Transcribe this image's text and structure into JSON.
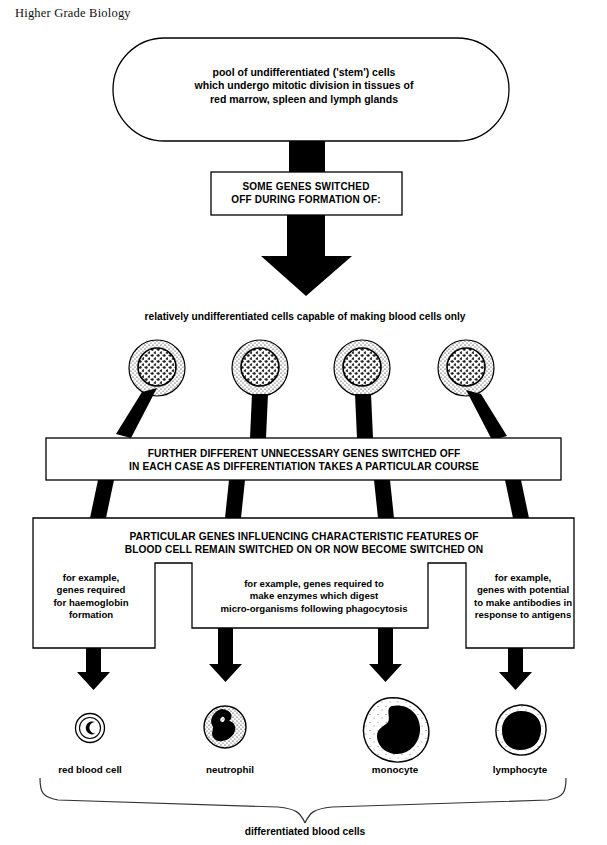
{
  "page": {
    "header": "Higher Grade Biology",
    "caption": "differentiated blood cells"
  },
  "boxes": {
    "stem_pool": {
      "line1": "pool of undifferentiated ('stem') cells",
      "line2": "which undergo mitotic division in tissues of",
      "line3": "red marrow, spleen and lymph glands"
    },
    "some_genes": {
      "line1": "SOME GENES SWITCHED",
      "line2": "OFF DURING FORMATION OF:"
    },
    "relatively_label": "relatively undifferentiated cells capable of making blood cells only",
    "further_genes": {
      "line1": "FURTHER DIFFERENT UNNECESSARY GENES SWITCHED OFF",
      "line2": "IN EACH CASE AS DIFFERENTIATION TAKES A PARTICULAR COURSE"
    },
    "particular_genes": {
      "line1": "PARTICULAR GENES INFLUENCING CHARACTERISTIC FEATURES OF",
      "line2": "BLOOD CELL REMAIN SWITCHED ON OR NOW BECOME SWITCHED ON"
    },
    "examples": [
      {
        "id": "haemoglobin",
        "line1": "for example,",
        "line2": "genes required",
        "line3": "for haemoglobin",
        "line4": "formation"
      },
      {
        "id": "enzymes",
        "line1": "for example, genes required to",
        "line2": "make enzymes which digest",
        "line3": "micro-organisms following phagocytosis",
        "line4": ""
      },
      {
        "id": "antibodies",
        "line1": "for example,",
        "line2": "genes with potential",
        "line3": "to make antibodies in",
        "line4": "response to antigens"
      }
    ]
  },
  "blood_cells": [
    {
      "id": "red-blood-cell",
      "label": "red blood cell"
    },
    {
      "id": "neutrophil",
      "label": "neutrophil"
    },
    {
      "id": "monocyte",
      "label": "monocyte"
    },
    {
      "id": "lymphocyte",
      "label": "lymphocyte"
    }
  ],
  "stem_cells": {
    "count": 4,
    "label": "stem-cell-illustration"
  },
  "colors": {
    "ink": "#000000",
    "paper": "#ffffff",
    "header_ink": "#111111"
  }
}
